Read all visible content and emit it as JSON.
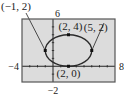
{
  "chart_data": {
    "type": "line",
    "title": "",
    "xlabel": "",
    "ylabel": "",
    "xlim": [
      -4,
      8
    ],
    "ylim": [
      -2,
      6
    ],
    "grid": false,
    "xscale_ticks": 1,
    "yscale_ticks": 1,
    "window_labels": {
      "xmin": "−4",
      "xmax": "8",
      "ymin": "−2",
      "ymax": "6"
    },
    "series": [
      {
        "name": "ellipse",
        "kind": "ellipse",
        "center": [
          2,
          2
        ],
        "rx": 3,
        "ry": 2
      }
    ],
    "points": [
      {
        "x": -1,
        "y": 2,
        "label": "(−1, 2)"
      },
      {
        "x": 2,
        "y": 4,
        "label": "(2, 4)"
      },
      {
        "x": 5,
        "y": 2,
        "label": "(5, 2)"
      },
      {
        "x": 2,
        "y": 0,
        "label": "(2, 0)"
      }
    ],
    "colors": {
      "background": "#dcdcdc",
      "curve": "#2a2a2a",
      "frame": "#555555"
    }
  }
}
